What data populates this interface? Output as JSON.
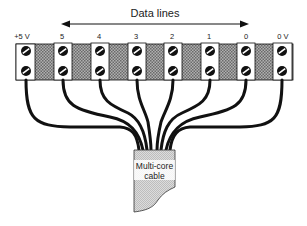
{
  "diagram": {
    "title_arrow_label": "Data lines",
    "terminals": [
      {
        "label": "+5  V",
        "x": 16
      },
      {
        "label": "5",
        "x": 54
      },
      {
        "label": "4",
        "x": 91
      },
      {
        "label": "3",
        "x": 128
      },
      {
        "label": "2",
        "x": 165
      },
      {
        "label": "1",
        "x": 202
      },
      {
        "label": "0",
        "x": 237
      },
      {
        "label": "0 V",
        "x": 273
      }
    ],
    "cable_label_line1": "Multi-core",
    "cable_label_line2": "cable",
    "colors": {
      "wire": "#111111",
      "strip_hatch": "#8a8a8a",
      "block_fill": "#ffffff",
      "cable_fill": "#d4d4d4"
    }
  }
}
